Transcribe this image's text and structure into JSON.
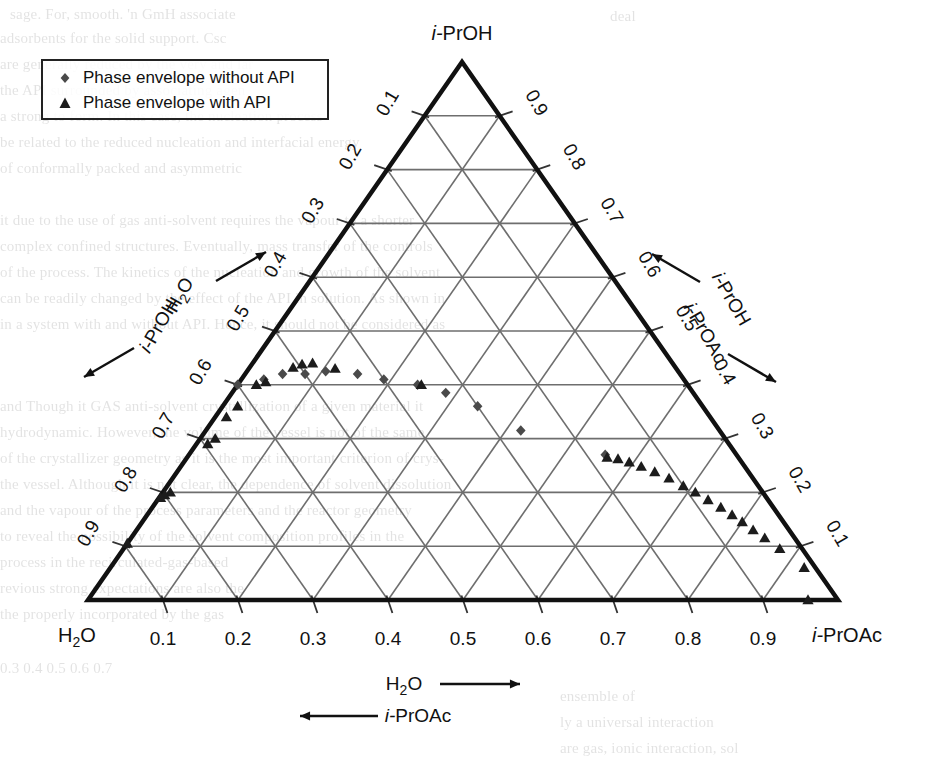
{
  "figure": {
    "type": "ternary-phase-diagram",
    "background_color": "#ffffff",
    "line_color": "#1a1a1a",
    "grid_color": "#6e6e6e"
  },
  "legend": {
    "position": "top-left",
    "entries": [
      {
        "label": "Phase envelope without API",
        "marker": "diamond",
        "color": "#4a4a4a"
      },
      {
        "label": "Phase envelope with API",
        "marker": "triangle",
        "color": "#1c1c1c"
      }
    ]
  },
  "vertices": {
    "top": "i-PrOH",
    "bottom_left": "H₂O",
    "bottom_right": "i-PrOAc"
  },
  "axes": {
    "bottom": {
      "ticks": [
        "0.1",
        "0.2",
        "0.3",
        "0.4",
        "0.5",
        "0.6",
        "0.7",
        "0.8",
        "0.9"
      ],
      "label_forward": "H₂O",
      "label_forward_arrow": "→",
      "label_reverse": "i-PrOAc",
      "label_reverse_arrow": "←"
    },
    "left": {
      "ticks": [
        "0.1",
        "0.2",
        "0.3",
        "0.4",
        "0.5",
        "0.6",
        "0.7",
        "0.8",
        "0.9"
      ],
      "label_forward": "H₂O",
      "label_forward_arrow": "↗",
      "label_reverse": "i-PrOH",
      "label_reverse_arrow": "↙"
    },
    "right": {
      "ticks": [
        "0.1",
        "0.2",
        "0.3",
        "0.4",
        "0.5",
        "0.6",
        "0.7",
        "0.8",
        "0.9"
      ],
      "label_forward": "i-PrOH",
      "label_forward_arrow": "↖",
      "label_reverse": "i-PrOAc",
      "label_reverse_arrow": "↘"
    }
  },
  "chart_data": {
    "type": "scatter",
    "plot_kind": "ternary",
    "title": "",
    "xlabel": "H₂O",
    "ylabel": "i-PrOH",
    "zlabel": "i-PrOAc",
    "axis_range": [
      0,
      1
    ],
    "grid": true,
    "legend_position": "top-left",
    "components": [
      "H2O",
      "i-PrOH",
      "i-PrOAc"
    ],
    "note": "Coordinates given as [water_fraction, iPrOH_fraction, iPrOAc_fraction] read off the ternary grid.",
    "series": [
      {
        "name": "Phase envelope without API",
        "marker": "diamond",
        "color": "#4a4a4a",
        "points": [
          [
            0.265,
            0.315,
            0.42
          ],
          [
            0.3,
            0.36,
            0.34
          ],
          [
            0.33,
            0.385,
            0.285
          ],
          [
            0.36,
            0.4,
            0.24
          ],
          [
            0.4,
            0.41,
            0.19
          ],
          [
            0.43,
            0.42,
            0.15
          ],
          [
            0.47,
            0.425,
            0.105
          ],
          [
            0.5,
            0.42,
            0.08
          ],
          [
            0.53,
            0.42,
            0.05
          ],
          [
            0.56,
            0.41,
            0.03
          ],
          [
            0.6,
            0.4,
            0.0
          ],
          [
            0.175,
            0.27,
            0.555
          ]
        ]
      },
      {
        "name": "Phase envelope with API",
        "marker": "triangle",
        "color": "#1c1c1c",
        "points": [
          [
            0.015,
            0.06,
            0.925
          ],
          [
            0.03,
            0.095,
            0.875
          ],
          [
            0.04,
            0.115,
            0.845
          ],
          [
            0.048,
            0.13,
            0.822
          ],
          [
            0.055,
            0.145,
            0.8
          ],
          [
            0.062,
            0.158,
            0.78
          ],
          [
            0.07,
            0.172,
            0.758
          ],
          [
            0.08,
            0.186,
            0.734
          ],
          [
            0.09,
            0.2,
            0.71
          ],
          [
            0.1,
            0.212,
            0.688
          ],
          [
            0.112,
            0.226,
            0.662
          ],
          [
            0.125,
            0.238,
            0.637
          ],
          [
            0.138,
            0.248,
            0.614
          ],
          [
            0.15,
            0.256,
            0.594
          ],
          [
            0.162,
            0.262,
            0.576
          ],
          [
            0.175,
            0.265,
            0.56
          ],
          [
            0.355,
            0.4,
            0.245
          ],
          [
            0.455,
            0.43,
            0.115
          ],
          [
            0.48,
            0.44,
            0.08
          ],
          [
            0.495,
            0.438,
            0.067
          ],
          [
            0.51,
            0.432,
            0.058
          ],
          [
            0.56,
            0.405,
            0.035
          ],
          [
            0.575,
            0.4,
            0.025
          ],
          [
            0.62,
            0.36,
            0.02
          ],
          [
            0.645,
            0.34,
            0.015
          ],
          [
            0.68,
            0.3,
            0.02
          ],
          [
            0.695,
            0.29,
            0.015
          ],
          [
            0.79,
            0.2,
            0.01
          ],
          [
            0.8,
            0.195,
            0.005
          ],
          [
            0.808,
            0.19,
            0.002
          ],
          [
            0.895,
            0.105,
            0.0
          ],
          [
            0.04,
            0.0,
            0.96
          ]
        ]
      }
    ]
  }
}
